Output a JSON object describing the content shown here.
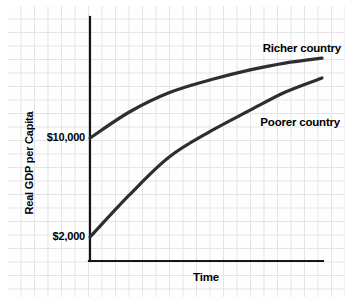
{
  "chart": {
    "ylabel": "Real GDP per Capita",
    "xlabel": "Time",
    "yticks": {
      "rich_start": "$10,000",
      "poor_start": "$2,000"
    },
    "series_labels": {
      "richer": "Richer country",
      "poorer": "Poorer country"
    },
    "colors": {
      "curve": "#2e2e30",
      "axis": "#151515",
      "grid": "#e4e4e6",
      "text": "#000000",
      "background": "#ffffff"
    }
  },
  "chart_data": {
    "type": "line",
    "title": "",
    "xlabel": "Time",
    "ylabel": "Real GDP per Capita",
    "x_axis": {
      "range": [
        0,
        1
      ],
      "tick_labels": [],
      "note": "unlabeled qualitative time axis"
    },
    "y_axis": {
      "tick_labels": [
        "$2,000",
        "$10,000"
      ],
      "tick_values": [
        2000,
        10000
      ]
    },
    "grid": "graph-paper background, not plot gridlines",
    "legend_position": "inline labels near right end of each curve",
    "x": [
      0,
      0.17,
      0.34,
      0.52,
      0.69,
      0.84,
      1
    ],
    "series": [
      {
        "name": "Richer country",
        "start_label": "$10,000",
        "values": [
          10000,
          12100,
          13650,
          14700,
          15500,
          16050,
          16450
        ]
      },
      {
        "name": "Poorer country",
        "start_label": "$2,000",
        "values": [
          2000,
          5400,
          8450,
          10550,
          12250,
          13700,
          14850
        ]
      }
    ]
  }
}
